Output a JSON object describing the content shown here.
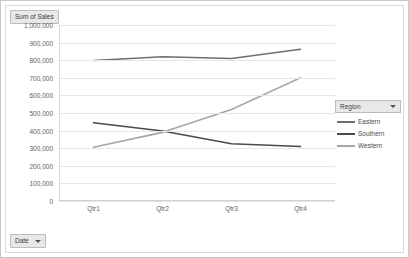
{
  "field_buttons": {
    "value_field": "Sum of Sales",
    "axis_field": "Date",
    "legend_field": "Region"
  },
  "icons": {
    "value_field_icon": "none",
    "axis_field_icon": "filter-dropdown-arrow",
    "legend_field_icon": "filter-dropdown-arrow"
  },
  "chart_data": {
    "type": "line",
    "title": "",
    "subtitle": "",
    "xlabel": "",
    "ylabel": "",
    "categories": [
      "Qtr1",
      "Qtr2",
      "Qtr3",
      "Qtr4"
    ],
    "series": [
      {
        "name": "Eastern",
        "values": [
          798000,
          820000,
          810000,
          862000
        ],
        "color": "#6e6e6e"
      },
      {
        "name": "Southern",
        "values": [
          445000,
          398000,
          325000,
          310000
        ],
        "color": "#4a4a4a"
      },
      {
        "name": "Western",
        "values": [
          305000,
          390000,
          520000,
          700000
        ],
        "color": "#a6a6a6"
      }
    ],
    "ylim": [
      0,
      1000000
    ],
    "ytick_step": 100000,
    "ytick_labels": [
      "1,000,000",
      "900,000",
      "800,000",
      "700,000",
      "600,000",
      "500,000",
      "400,000",
      "300,000",
      "200,000",
      "100,000",
      "0"
    ],
    "grid": true,
    "legend_position": "right",
    "legend_entries": [
      "Eastern",
      "Southern",
      "Western"
    ]
  }
}
